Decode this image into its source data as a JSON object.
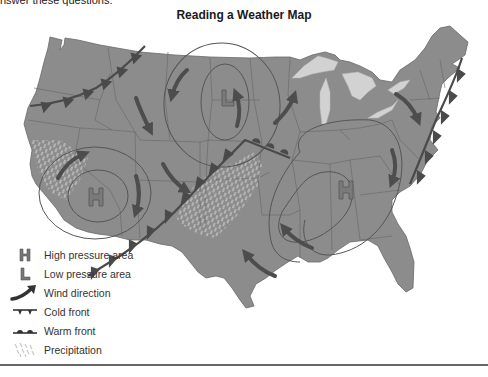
{
  "header": {
    "instruction_text": "nswer these questions.",
    "title": "Reading a Weather Map"
  },
  "colors": {
    "land": "#8c8c8c",
    "border": "#5f5f5f",
    "lakes": "#d2d2d2",
    "isobar": "#555555",
    "arrow": "#4d4d4d",
    "front": "#4a4a4a",
    "precipitation": "#c8c8c8",
    "pressure_symbol": "#7a7a7a"
  },
  "map": {
    "region": "Contiguous United States",
    "pressure_systems": [
      {
        "type": "high",
        "symbol": "H",
        "location": "southwest (Nevada / California)"
      },
      {
        "type": "low",
        "symbol": "L",
        "location": "north central (Dakotas / Nebraska)"
      },
      {
        "type": "high",
        "symbol": "H",
        "location": "east central (Kentucky / Tennessee)"
      }
    ],
    "fronts": [
      {
        "type": "cold",
        "location": "Pacific Northwest, from Montana to northern California coast"
      },
      {
        "type": "cold",
        "location": "from Missouri southwest through Oklahoma/Texas panhandle to New Mexico"
      },
      {
        "type": "cold",
        "location": "Atlantic coast, from Maine to the Carolinas"
      },
      {
        "type": "warm",
        "location": "segment from Kansas to Kentucky"
      }
    ],
    "precipitation_areas": [
      "northern California coast",
      "Oklahoma / north Texas along the cold front"
    ],
    "wind_directions": [
      "clockwise around the western high",
      "counter-clockwise around the low",
      "clockwise around the eastern high"
    ]
  },
  "legend": [
    {
      "icon": "high-pressure-icon",
      "symbol": "H",
      "label": "High pressure area"
    },
    {
      "icon": "low-pressure-icon",
      "symbol": "L",
      "label": "Low pressure area"
    },
    {
      "icon": "wind-arrow-icon",
      "symbol": "",
      "label": "Wind direction"
    },
    {
      "icon": "cold-front-icon",
      "symbol": "",
      "label": "Cold front"
    },
    {
      "icon": "warm-front-icon",
      "symbol": "",
      "label": "Warm front"
    },
    {
      "icon": "precipitation-icon",
      "symbol": "",
      "label": "Precipitation"
    }
  ]
}
